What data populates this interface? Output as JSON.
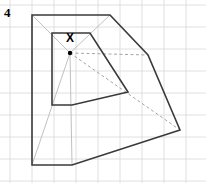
{
  "figure": {
    "question_number": "4",
    "canvas": {
      "width": 206,
      "height": 183,
      "background": "#ffffff"
    },
    "grid": {
      "visible": true,
      "spacing": 22,
      "origin_x": 10,
      "origin_y": 5,
      "color": "#d8d8dc",
      "line_width": 0.8
    },
    "centre_point": {
      "label": "X",
      "label_x": 70,
      "label_y": 34,
      "dot_x": 70,
      "dot_y": 53,
      "dot_radius": 2.2,
      "color": "#000000"
    },
    "inner_shape": {
      "name": "original-quadrilateral",
      "stroke": "#3a3a3a",
      "stroke_width": 1.6,
      "fill": "none",
      "points": "52,33 90,33 128,92 72,105 52,105"
    },
    "outer_shape": {
      "name": "enlarged-quadrilateral",
      "stroke": "#3a3a3a",
      "stroke_width": 1.6,
      "fill": "none",
      "points": "32,15 110,15 148,55 180,130 72,165 32,165"
    },
    "rays": {
      "name": "construction-rays",
      "stroke": "#b9b9bd",
      "stroke_width": 0.9,
      "dash": "none",
      "lines": [
        {
          "x1": 70,
          "y1": 53,
          "x2": 32,
          "y2": 15
        },
        {
          "x1": 70,
          "y1": 53,
          "x2": 110,
          "y2": 15
        },
        {
          "x1": 70,
          "y1": 53,
          "x2": 32,
          "y2": 165
        },
        {
          "x1": 70,
          "y1": 53,
          "x2": 72,
          "y2": 165
        }
      ]
    },
    "dashed_rays": {
      "name": "dashed-construction-rays",
      "stroke": "#9a9a9e",
      "stroke_width": 0.9,
      "dash": "3 2.5",
      "lines": [
        {
          "x1": 70,
          "y1": 53,
          "x2": 180,
          "y2": 130
        },
        {
          "x1": 70,
          "y1": 53,
          "x2": 148,
          "y2": 55
        }
      ]
    }
  },
  "chart_data": {
    "type": "diagram",
    "grid": true,
    "grid_spacing_px": 22,
    "centre_of_enlargement": {
      "label": "X",
      "x": 70,
      "y": 53
    },
    "shapes": [
      {
        "name": "original",
        "vertices": [
          [
            52,
            33
          ],
          [
            90,
            33
          ],
          [
            128,
            92
          ],
          [
            72,
            105
          ],
          [
            52,
            105
          ]
        ]
      },
      {
        "name": "image",
        "vertices": [
          [
            32,
            15
          ],
          [
            110,
            15
          ],
          [
            148,
            55
          ],
          [
            180,
            130
          ],
          [
            72,
            165
          ],
          [
            32,
            165
          ]
        ]
      }
    ],
    "annotations": [
      "4",
      "X"
    ]
  }
}
